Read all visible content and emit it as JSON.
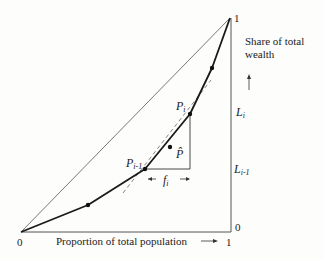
{
  "diagram": {
    "type": "lorenz-curve",
    "x_axis": {
      "label": "Proportion of total population",
      "arrow": "→",
      "tick_start": "0",
      "tick_end": "1"
    },
    "y_axis": {
      "label_line1": "Share of total",
      "label_line2": "wealth",
      "arrow": "↑",
      "tick_start": "0",
      "tick_end": "1",
      "marks": [
        {
          "name": "L",
          "sub": "i"
        },
        {
          "name": "L",
          "sub": "i-1"
        }
      ]
    },
    "points": {
      "p_prev": {
        "name": "P",
        "sub": "i-1"
      },
      "p_curr": {
        "name": "P",
        "sub": "i"
      },
      "p_hat": {
        "name": "P̂"
      }
    },
    "interval": {
      "name": "f",
      "sub": "i",
      "left_arrow": "←",
      "right_arrow": "→"
    },
    "colors": {
      "curve": "#1a1a1a",
      "diagonal": "#555555",
      "dashed": "#666666",
      "axis": "#555555"
    }
  }
}
